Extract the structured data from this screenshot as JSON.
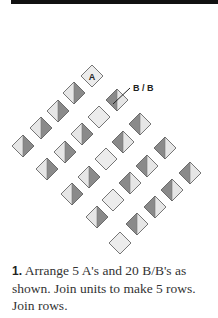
{
  "header": {
    "bar_color": "#111111"
  },
  "diagram": {
    "colors": {
      "light": "#e6e6e6",
      "dark": "#8a8a8a",
      "plain": "#ececec",
      "outline": "#555555"
    },
    "half_size": 11,
    "callout_label": "B / B",
    "a_label": "A",
    "rows": [
      {
        "name": "row-1",
        "units": [
          {
            "x": 92,
            "y": 76,
            "type": "A"
          },
          {
            "x": 74,
            "y": 93,
            "type": "BB-light-left"
          },
          {
            "x": 58,
            "y": 111,
            "type": "BB-light-left"
          },
          {
            "x": 41,
            "y": 128,
            "type": "BB-light-left"
          },
          {
            "x": 23,
            "y": 146,
            "type": "BB-light-left"
          }
        ]
      },
      {
        "name": "row-2",
        "units": [
          {
            "x": 117,
            "y": 100,
            "type": "BB-dark-left"
          },
          {
            "x": 99,
            "y": 117,
            "type": "A"
          },
          {
            "x": 82,
            "y": 134,
            "type": "BB-light-left"
          },
          {
            "x": 65,
            "y": 152,
            "type": "BB-light-left"
          },
          {
            "x": 47,
            "y": 169,
            "type": "BB-light-left"
          }
        ]
      },
      {
        "name": "row-3",
        "units": [
          {
            "x": 140,
            "y": 124,
            "type": "BB-dark-left"
          },
          {
            "x": 123,
            "y": 142,
            "type": "BB-dark-left"
          },
          {
            "x": 106,
            "y": 159,
            "type": "A"
          },
          {
            "x": 89,
            "y": 177,
            "type": "BB-light-left"
          },
          {
            "x": 72,
            "y": 194,
            "type": "BB-light-left"
          }
        ]
      },
      {
        "name": "row-4",
        "units": [
          {
            "x": 165,
            "y": 148,
            "type": "BB-dark-left"
          },
          {
            "x": 147,
            "y": 166,
            "type": "BB-dark-left"
          },
          {
            "x": 130,
            "y": 183,
            "type": "BB-dark-left"
          },
          {
            "x": 113,
            "y": 200,
            "type": "A"
          },
          {
            "x": 97,
            "y": 217,
            "type": "BB-light-left"
          }
        ]
      },
      {
        "name": "row-5",
        "units": [
          {
            "x": 190,
            "y": 173,
            "type": "BB-dark-left"
          },
          {
            "x": 172,
            "y": 190,
            "type": "BB-dark-left"
          },
          {
            "x": 155,
            "y": 207,
            "type": "BB-dark-left"
          },
          {
            "x": 137,
            "y": 224,
            "type": "BB-dark-left"
          },
          {
            "x": 120,
            "y": 243,
            "type": "A"
          }
        ]
      }
    ],
    "labeled_a": {
      "x": 92,
      "y": 76
    },
    "callout": {
      "from_x": 113,
      "from_y": 104,
      "to_x": 130,
      "to_y": 88,
      "text_x": 133,
      "text_y": 91
    }
  },
  "caption": {
    "number": "1.",
    "text": " Arrange 5 A's and 20 B/B's as shown. Join units to make 5 rows. Join rows."
  }
}
